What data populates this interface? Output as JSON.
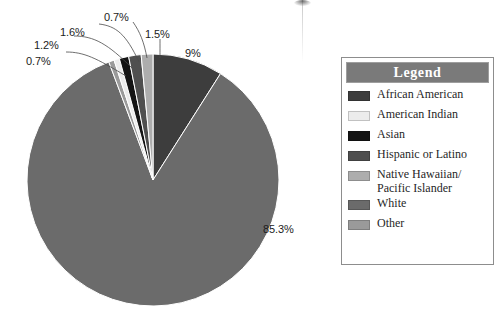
{
  "chart_data": {
    "type": "pie",
    "title": "",
    "categories": [
      "African American",
      "American Indian",
      "Asian",
      "Hispanic or Latino",
      "Native Hawaiian/Pacific Islander",
      "White",
      "Other"
    ],
    "values": [
      9,
      0.7,
      1.2,
      1.6,
      1.5,
      85.3,
      0.7
    ],
    "value_labels": [
      "9%",
      "0.7%",
      "1.2%",
      "1.6%",
      "1.5%",
      "85.3%",
      "0.7%"
    ],
    "colors": [
      "#3d3d3d",
      "#ececec",
      "#141414",
      "#4f4f4f",
      "#adadad",
      "#6b6b6b",
      "#9a9a9a"
    ],
    "legend_position": "right",
    "grid": false,
    "start_angle_deg": 0,
    "direction": "clockwise"
  },
  "pie": {
    "labels": [
      {
        "text": "0.7%",
        "x": 26,
        "y": 55,
        "category": "Other"
      },
      {
        "text": "1.2%",
        "x": 34,
        "y": 39,
        "category": "American Indian"
      },
      {
        "text": "1.6%",
        "x": 60,
        "y": 26,
        "category": "Asian"
      },
      {
        "text": "0.7%",
        "x": 104,
        "y": 11,
        "category": "Hispanic or Latino"
      },
      {
        "text": "1.5%",
        "x": 145,
        "y": 28,
        "category": "Native Hawaiian/Pacific Islander"
      },
      {
        "text": "9%",
        "x": 185,
        "y": 47,
        "category": "African American"
      },
      {
        "text": "85.3%",
        "x": 263,
        "y": 223,
        "category": "White"
      }
    ]
  },
  "legend": {
    "title": "Legend",
    "title_bg": "#7a7a7a",
    "items": [
      {
        "label": "African American",
        "label_line2": "",
        "color": "#3d3d3d"
      },
      {
        "label": "American Indian",
        "label_line2": "",
        "color": "#ececec"
      },
      {
        "label": "Asian",
        "label_line2": "",
        "color": "#141414"
      },
      {
        "label": "Hispanic or Latino",
        "label_line2": "",
        "color": "#4f4f4f"
      },
      {
        "label": "Native Hawaiian/",
        "label_line2": "Pacific Islander",
        "color": "#adadad"
      },
      {
        "label": "White",
        "label_line2": "",
        "color": "#6b6b6b"
      },
      {
        "label": "Other",
        "label_line2": "",
        "color": "#9a9a9a"
      }
    ]
  }
}
